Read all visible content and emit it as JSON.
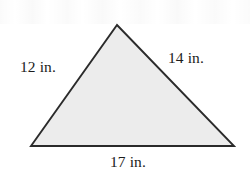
{
  "figure": {
    "type": "triangle-diagram",
    "background_color": "#ffffff",
    "fill_color": "#ececec",
    "stroke_color": "#2b2b2b",
    "text_color": "#1c1c1c",
    "vertices": {
      "apex": {
        "x": 117,
        "y": 25
      },
      "bottom_left": {
        "x": 31,
        "y": 146
      },
      "bottom_right": {
        "x": 234,
        "y": 146
      }
    },
    "sides": [
      {
        "name": "left-side",
        "label": "12 in.",
        "value": 12,
        "unit": "in."
      },
      {
        "name": "right-side",
        "label": "14 in.",
        "value": 14,
        "unit": "in."
      },
      {
        "name": "bottom-side",
        "label": "17 in.",
        "value": 17,
        "unit": "in."
      }
    ]
  }
}
